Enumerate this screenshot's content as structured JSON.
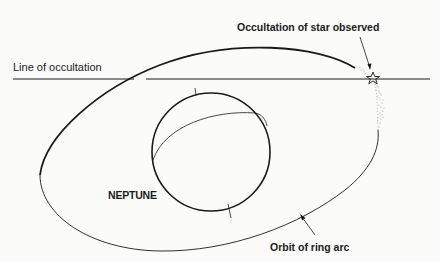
{
  "diagram": {
    "labels": {
      "line_of_occultation": "Line of occultation",
      "star_observed": "Occultation of star observed",
      "planet": "NEPTUNE",
      "orbit": "Orbit of ring arc"
    },
    "colors": {
      "ink": "#1a1a1a",
      "background": "#fbfbfa",
      "stipple": "#9a9a9a"
    }
  }
}
